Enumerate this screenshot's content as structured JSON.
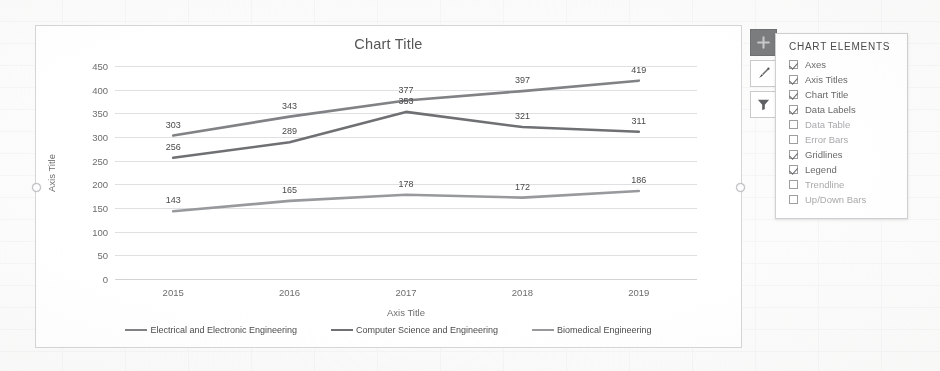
{
  "chart_data": {
    "type": "line",
    "title": "Chart Title",
    "xlabel": "Axis Title",
    "ylabel": "Axis Title",
    "categories": [
      "2015",
      "2016",
      "2017",
      "2018",
      "2019"
    ],
    "ylim": [
      0,
      450
    ],
    "yticks": [
      0,
      50,
      100,
      150,
      200,
      250,
      300,
      350,
      400,
      450
    ],
    "grid": true,
    "legend_position": "bottom",
    "data_labels": true,
    "series": [
      {
        "name": "Electrical and Electronic Engineering",
        "color": "#808285",
        "values": [
          303,
          343,
          377,
          397,
          419
        ]
      },
      {
        "name": "Computer Science and Engineering",
        "color": "#6e7073",
        "values": [
          256,
          289,
          353,
          321,
          311
        ]
      },
      {
        "name": "Biomedical Engineering",
        "color": "#97999c",
        "values": [
          143,
          165,
          178,
          172,
          186
        ]
      }
    ]
  },
  "chart_tools": {
    "buttons": [
      {
        "name": "chart-elements-button",
        "icon": "plus-icon",
        "active": true
      },
      {
        "name": "chart-styles-button",
        "icon": "paintbrush-icon",
        "active": false
      },
      {
        "name": "chart-filters-button",
        "icon": "funnel-icon",
        "active": false
      }
    ]
  },
  "elements_panel": {
    "title": "CHART ELEMENTS",
    "items": [
      {
        "label": "Axes",
        "checked": true
      },
      {
        "label": "Axis Titles",
        "checked": true
      },
      {
        "label": "Chart Title",
        "checked": true
      },
      {
        "label": "Data Labels",
        "checked": true
      },
      {
        "label": "Data Table",
        "checked": false
      },
      {
        "label": "Error Bars",
        "checked": false
      },
      {
        "label": "Gridlines",
        "checked": true
      },
      {
        "label": "Legend",
        "checked": true
      },
      {
        "label": "Trendline",
        "checked": false
      },
      {
        "label": "Up/Down Bars",
        "checked": false
      }
    ]
  }
}
